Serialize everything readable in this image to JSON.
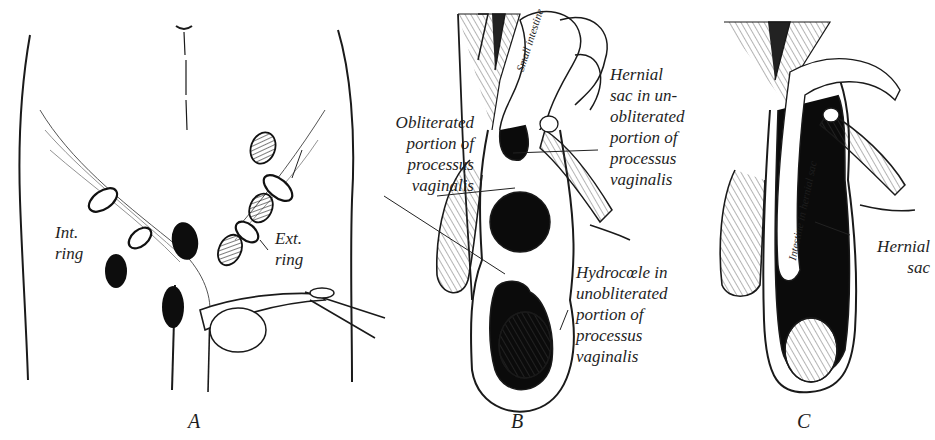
{
  "figure": {
    "panels": [
      {
        "id": "A",
        "letter": "A",
        "labels": {
          "internal_ring": "Int.\nring",
          "external_ring": "Ext.\nring"
        }
      },
      {
        "id": "B",
        "letter": "B",
        "labels": {
          "small_intestine": "Small intestine",
          "obliterated": "Obliterated\nportion of\nprocessus\nvaginalis",
          "hernial_sac": "Hernial\nsac in un-\nobliterated\nportion of\nprocessus\nvaginalis",
          "hydrocele": "Hydrocœle in\nunobliterated\nportion of\nprocessus\nvaginalis"
        }
      },
      {
        "id": "C",
        "letter": "C",
        "labels": {
          "intestine_in_sac": "Intestine in hernial sac",
          "hernial_sac": "Hernial\nsac"
        }
      }
    ]
  }
}
